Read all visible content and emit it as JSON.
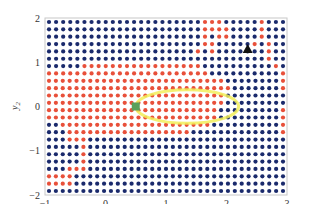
{
  "chart_data": {
    "type": "scatter",
    "title": "",
    "xlabel": "x1",
    "ylabel": "y2",
    "xlabel_main": "x",
    "xlabel_sub": "1",
    "ylabel_main": "y",
    "ylabel_sub": "2",
    "xlim": [
      -1,
      3
    ],
    "ylim": [
      -2,
      2
    ],
    "xticks": [
      -1,
      0,
      1,
      2,
      3
    ],
    "yticks": [
      -2,
      -1,
      0,
      1,
      2
    ],
    "xtick_labels": [
      "−1",
      "0",
      "1",
      "2",
      "3"
    ],
    "ytick_labels": [
      "−2",
      "−1",
      "0",
      "1",
      "2"
    ],
    "grid": false,
    "legend": null,
    "colors": {
      "red": "#e8503a",
      "blue": "#1a2a6c",
      "ellipse": "#f2ee5a",
      "start_marker": "#5aa05a",
      "goal_marker": "#111111",
      "frame": "#c8c8c8"
    },
    "grid_points": {
      "x_start": -0.94,
      "x_step": 0.125,
      "cols": 32,
      "y_start": 1.92,
      "y_step": -0.167,
      "rows": 24,
      "class_rows": [
        "bbbbbbbbbbbbbbbbbbbbbbrrrbbbbbrbbb",
        "bbbbbbbbbbbbbbbbbbbbbbrrrrbbbbrbbb",
        "bbbbbbbbbbbbbbbbbbbbbbrbrrbbbbrbbb",
        "bbbbbbbbbbbbbbbbbbbbbbrrbbbbbrbrbb",
        "bbbbbbbbbbbbbbbbbbbbbrbrbbbbbbbrbb",
        "bbbbbbbbbbbbbbbbbbbbbbbbbbbbbbbrbb",
        "bbbbbrrrrrrrrrrrrrrrrrbbbbbbbbbbrb",
        "rrrrrrrrrrrrrrrrrrrrrrrbbbbbbbbbbr",
        "rrrrrrrrrrrrrrrrrrrrrrrrrrbbbbbbbbr",
        "rrrrrrrrrrrrrrrrrrrrrrrrrrrbbbbbbbr",
        "rrrrrrrrrrrrrrrrrrrrrrrrrrbbbbbbbbb",
        "rrrrrrrrrrrrrrrrrrrrrrrrrrbbbbbbbbb",
        "rrrrrrrrrrrrrrrrrrrrrrrrrbbbbbbbbbr",
        "rrrrrrrrrrrrrrrrrrrrrrrrrbbbbbbbbbr",
        "bbrrrrrrrrrrrrrrrrrrrrrrbbbbbbbbbbr",
        "bbbrrrrrrrrrrrrrrrrrrbbbbbbbbbbbbbr",
        "bbbrrrbbbbbbbbbbbbbbbbbbbbbbbbbbbbb",
        "bbbbbrbbbbbbbbbbbbbbbbbbbbbbbbbbbbb",
        "bbbbbrbbbbbbbbbbbbbbbbbbbbbbbbbbbbb",
        "bbbbbrbbbbbbbbbbbbbbbbbbbbbbbbbbbbb",
        "bbbrrrbbbbbbbbbbbbbbbbbbbbbbbbbbbbb",
        "rrrrbbbbbbbbbbbbbbbbbbbbbbbbbbbbbbb",
        "rrrrbbbbbbbbbbbbbbbbbbbbbbbbbbbbbbb",
        "bbbbbbbbbbbbbbbbbbbbbbbbbbbbbbbbbbb"
      ]
    },
    "ellipse": {
      "cx": 1.35,
      "cy": 0.0,
      "rx": 0.85,
      "ry": 0.38,
      "stroke_width": 3
    },
    "start_marker": {
      "shape": "square",
      "x": 0.5,
      "y": 0.0,
      "color": "#5aa05a"
    },
    "goal_marker": {
      "shape": "triangle",
      "x": 2.35,
      "y": 1.3,
      "color": "#111111"
    },
    "series": [
      {
        "name": "class red",
        "color": "#e8503a"
      },
      {
        "name": "class blue",
        "color": "#1a2a6c"
      }
    ]
  }
}
